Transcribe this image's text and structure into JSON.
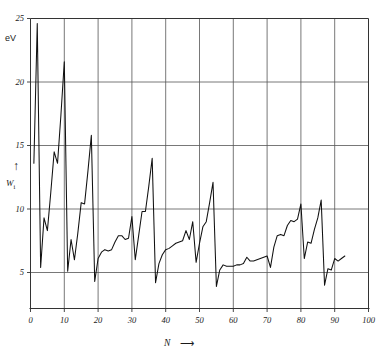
{
  "chart_data": {
    "type": "line",
    "title": "",
    "xlabel": "N",
    "ylabel": "W",
    "ylabel_sub": "i",
    "yunit": "eV",
    "xlim": [
      0,
      100
    ],
    "ylim": [
      3.0,
      25.8
    ],
    "xticks": [
      0,
      10,
      20,
      30,
      40,
      50,
      60,
      70,
      80,
      90,
      100
    ],
    "yticks": [
      5,
      10,
      15,
      20,
      25
    ],
    "grid": true,
    "grid_color": "#555555",
    "line_color": "#111111",
    "xtick_labels": [
      "0",
      "10",
      "20",
      "30",
      "40",
      "50",
      "60",
      "70",
      "80",
      "90",
      "100"
    ],
    "ytick_labels": [
      "5",
      "10",
      "15",
      "20",
      "25"
    ],
    "x": [
      1,
      2,
      3,
      4,
      5,
      6,
      7,
      8,
      9,
      10,
      11,
      12,
      13,
      14,
      15,
      16,
      17,
      18,
      19,
      20,
      21,
      22,
      23,
      24,
      25,
      26,
      27,
      28,
      29,
      30,
      31,
      32,
      33,
      34,
      35,
      36,
      37,
      38,
      39,
      40,
      41,
      42,
      43,
      44,
      45,
      46,
      47,
      48,
      49,
      50,
      51,
      52,
      53,
      54,
      55,
      56,
      57,
      58,
      59,
      60,
      61,
      62,
      63,
      64,
      65,
      66,
      67,
      68,
      69,
      70,
      71,
      72,
      73,
      74,
      75,
      76,
      77,
      78,
      79,
      80,
      81,
      82,
      83,
      84,
      85,
      86,
      87,
      88,
      89,
      90,
      91,
      92,
      93
    ],
    "values": [
      13.6,
      24.6,
      5.4,
      9.3,
      8.3,
      11.3,
      14.5,
      13.6,
      17.4,
      21.6,
      5.1,
      7.6,
      6.0,
      8.1,
      10.5,
      10.4,
      13.0,
      15.8,
      4.3,
      6.1,
      6.6,
      6.8,
      6.7,
      6.8,
      7.4,
      7.9,
      7.9,
      7.6,
      7.7,
      9.4,
      6.0,
      7.9,
      9.8,
      9.8,
      11.8,
      14.0,
      4.2,
      5.7,
      6.4,
      6.8,
      6.9,
      7.1,
      7.3,
      7.4,
      7.5,
      8.3,
      7.6,
      9.0,
      5.8,
      7.3,
      8.6,
      9.0,
      10.5,
      12.1,
      3.9,
      5.2,
      5.6,
      5.5,
      5.5,
      5.5,
      5.6,
      5.6,
      5.7,
      6.2,
      5.9,
      5.9,
      6.0,
      6.1,
      6.2,
      6.3,
      5.4,
      7.0,
      7.9,
      8.0,
      7.9,
      8.7,
      9.1,
      9.0,
      9.2,
      10.4,
      6.1,
      7.4,
      7.3,
      8.4,
      9.3,
      10.7,
      4.0,
      5.3,
      5.2,
      6.1,
      5.9,
      6.1,
      6.3
    ],
    "series_name": "first ionization potential",
    "notes_peaks": [
      {
        "x": 2,
        "y": 24.6,
        "element": "He"
      },
      {
        "x": 10,
        "y": 21.6,
        "element": "Ne"
      },
      {
        "x": 18,
        "y": 15.8,
        "element": "Ar"
      },
      {
        "x": 36,
        "y": 14.0,
        "element": "Kr"
      },
      {
        "x": 54,
        "y": 12.1,
        "element": "Xe"
      },
      {
        "x": 86,
        "y": 10.7,
        "element": "Rn"
      }
    ],
    "notes_minima": [
      {
        "x": 3,
        "y": 5.4,
        "element": "Li"
      },
      {
        "x": 11,
        "y": 5.1,
        "element": "Na"
      },
      {
        "x": 19,
        "y": 4.3,
        "element": "K"
      },
      {
        "x": 37,
        "y": 4.2,
        "element": "Rb"
      },
      {
        "x": 55,
        "y": 3.9,
        "element": "Cs"
      },
      {
        "x": 87,
        "y": 4.0,
        "element": "Fr"
      }
    ]
  }
}
